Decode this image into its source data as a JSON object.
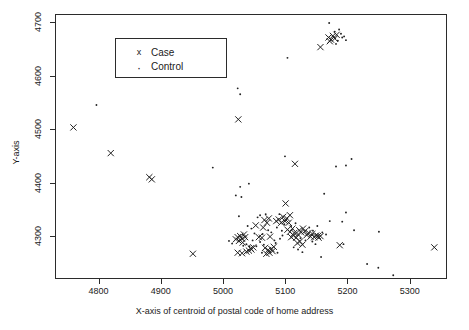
{
  "chart_data": {
    "type": "scatter",
    "title": "",
    "xlabel": "X-axis of centroid of postal code of home address",
    "ylabel": "Y-axis",
    "xlim": [
      4730,
      5360
    ],
    "ylim": [
      4220,
      4715
    ],
    "xticks": [
      4800,
      4900,
      5000,
      5100,
      5200,
      5300
    ],
    "yticks": [
      4300,
      4400,
      4500,
      4600,
      4700
    ],
    "grid": false,
    "legend_position": "top-left",
    "legend": [
      {
        "key": "x",
        "label": "Case",
        "marker": "cross"
      },
      {
        "key": ".",
        "label": "Control",
        "marker": "dot"
      }
    ],
    "series": [
      {
        "name": "Case",
        "marker": "cross",
        "color": "#222222",
        "points": [
          [
            4758,
            4505
          ],
          [
            4818,
            4457
          ],
          [
            4880,
            4412
          ],
          [
            4884,
            4408
          ],
          [
            4950,
            4269
          ],
          [
            5023,
            4520
          ],
          [
            5114,
            4437
          ],
          [
            5099,
            4363
          ],
          [
            5151,
            4302
          ],
          [
            5338,
            4281
          ],
          [
            5022,
            4300
          ],
          [
            5026,
            4302
          ],
          [
            5029,
            4297
          ],
          [
            5032,
            4305
          ],
          [
            5019,
            4296
          ],
          [
            5024,
            4293
          ],
          [
            5030,
            4290
          ],
          [
            5034,
            4300
          ],
          [
            5022,
            4271
          ],
          [
            5029,
            4270
          ],
          [
            5040,
            4275
          ],
          [
            5044,
            4277
          ],
          [
            5051,
            4322
          ],
          [
            5056,
            4300
          ],
          [
            5061,
            4299
          ],
          [
            5063,
            4318
          ],
          [
            5065,
            4332
          ],
          [
            5069,
            4327
          ],
          [
            5072,
            4335
          ],
          [
            5074,
            4301
          ],
          [
            5066,
            4280
          ],
          [
            5071,
            4276
          ],
          [
            5076,
            4278
          ],
          [
            5080,
            4282
          ],
          [
            5068,
            4269
          ],
          [
            5073,
            4271
          ],
          [
            5078,
            4274
          ],
          [
            5084,
            4330
          ],
          [
            5088,
            4333
          ],
          [
            5092,
            4327
          ],
          [
            5095,
            4338
          ],
          [
            5098,
            4330
          ],
          [
            5101,
            4335
          ],
          [
            5104,
            4327
          ],
          [
            5106,
            4341
          ],
          [
            5102,
            4314
          ],
          [
            5106,
            4310
          ],
          [
            5110,
            4316
          ],
          [
            5113,
            4308
          ],
          [
            5108,
            4300
          ],
          [
            5112,
            4303
          ],
          [
            5116,
            4299
          ],
          [
            5119,
            4305
          ],
          [
            5121,
            4313
          ],
          [
            5124,
            4309
          ],
          [
            5127,
            4316
          ],
          [
            5130,
            4311
          ],
          [
            5133,
            4304
          ],
          [
            5136,
            4308
          ],
          [
            5139,
            4301
          ],
          [
            5142,
            4306
          ],
          [
            5145,
            4300
          ],
          [
            5148,
            4303
          ],
          [
            5152,
            4299
          ],
          [
            5155,
            4302
          ],
          [
            5118,
            4289
          ],
          [
            5122,
            4292
          ],
          [
            5126,
            4286
          ],
          [
            5186,
            4285
          ],
          [
            5043,
            4279
          ],
          [
            5047,
            4281
          ],
          [
            5036,
            4273
          ],
          [
            5155,
            4655
          ],
          [
            5168,
            4673
          ],
          [
            5172,
            4669
          ],
          [
            5175,
            4676
          ],
          [
            5178,
            4671
          ],
          [
            5181,
            4678
          ],
          [
            5170,
            4666
          ]
        ]
      },
      {
        "name": "Control",
        "marker": "dot",
        "color": "#222222",
        "points": [
          [
            4795,
            4547
          ],
          [
            4982,
            4430
          ],
          [
            5026,
            4567
          ],
          [
            5022,
            4578
          ],
          [
            5040,
            4400
          ],
          [
            5026,
            4394
          ],
          [
            5019,
            4378
          ],
          [
            5028,
            4375
          ],
          [
            5102,
            4635
          ],
          [
            5169,
            4700
          ],
          [
            5180,
            4661
          ],
          [
            5188,
            4680
          ],
          [
            5190,
            4673
          ],
          [
            5183,
            4667
          ],
          [
            5193,
            4675
          ],
          [
            5178,
            4684
          ],
          [
            5185,
            4688
          ],
          [
            5196,
            4668
          ],
          [
            5098,
            4451
          ],
          [
            5180,
            4432
          ],
          [
            5196,
            4434
          ],
          [
            5205,
            4446
          ],
          [
            5161,
            4381
          ],
          [
            5196,
            4346
          ],
          [
            5190,
            4329
          ],
          [
            5024,
            4339
          ],
          [
            5038,
            4321
          ],
          [
            5044,
            4316
          ],
          [
            5049,
            4307
          ],
          [
            5054,
            4337
          ],
          [
            5058,
            4341
          ],
          [
            5062,
            4306
          ],
          [
            5067,
            4343
          ],
          [
            5071,
            4313
          ],
          [
            5076,
            4309
          ],
          [
            5081,
            4294
          ],
          [
            5085,
            4318
          ],
          [
            5089,
            4343
          ],
          [
            5093,
            4312
          ],
          [
            5097,
            4324
          ],
          [
            5058,
            4291
          ],
          [
            5046,
            4294
          ],
          [
            5036,
            4287
          ],
          [
            5031,
            4284
          ],
          [
            5052,
            4283
          ],
          [
            5064,
            4286
          ],
          [
            5083,
            4289
          ],
          [
            5090,
            4297
          ],
          [
            5094,
            4303
          ],
          [
            5108,
            4321
          ],
          [
            5115,
            4326
          ],
          [
            5123,
            4298
          ],
          [
            5131,
            4294
          ],
          [
            5137,
            4318
          ],
          [
            5143,
            4312
          ],
          [
            5150,
            4321
          ],
          [
            5158,
            4309
          ],
          [
            5164,
            4305
          ],
          [
            5170,
            4330
          ],
          [
            5112,
            4281
          ],
          [
            5119,
            4277
          ],
          [
            5142,
            4292
          ],
          [
            5147,
            4287
          ],
          [
            5126,
            4272
          ],
          [
            5156,
            4263
          ],
          [
            5192,
            4287
          ],
          [
            5249,
            4310
          ],
          [
            5230,
            4250
          ],
          [
            5248,
            4243
          ],
          [
            5272,
            4229
          ],
          [
            5209,
            4313
          ],
          [
            5041,
            4283
          ],
          [
            5013,
            4288
          ],
          [
            5008,
            4293
          ],
          [
            5061,
            4271
          ],
          [
            5086,
            4271
          ]
        ]
      }
    ]
  },
  "axes": {
    "x_title": "X-axis of centroid of postal code of home address",
    "y_title": "Y-axis",
    "x_tick_labels": [
      "4800",
      "4900",
      "5000",
      "5100",
      "5200",
      "5300"
    ],
    "y_tick_labels": [
      "4300",
      "4400",
      "4500",
      "4600",
      "4700"
    ]
  },
  "legend": {
    "case_key": "x",
    "case_label": "Case",
    "control_key": "·",
    "control_label": "Control"
  },
  "style": {
    "marker_color": "#222222",
    "frame_color": "#2b2b2b",
    "background": "#ffffff"
  }
}
